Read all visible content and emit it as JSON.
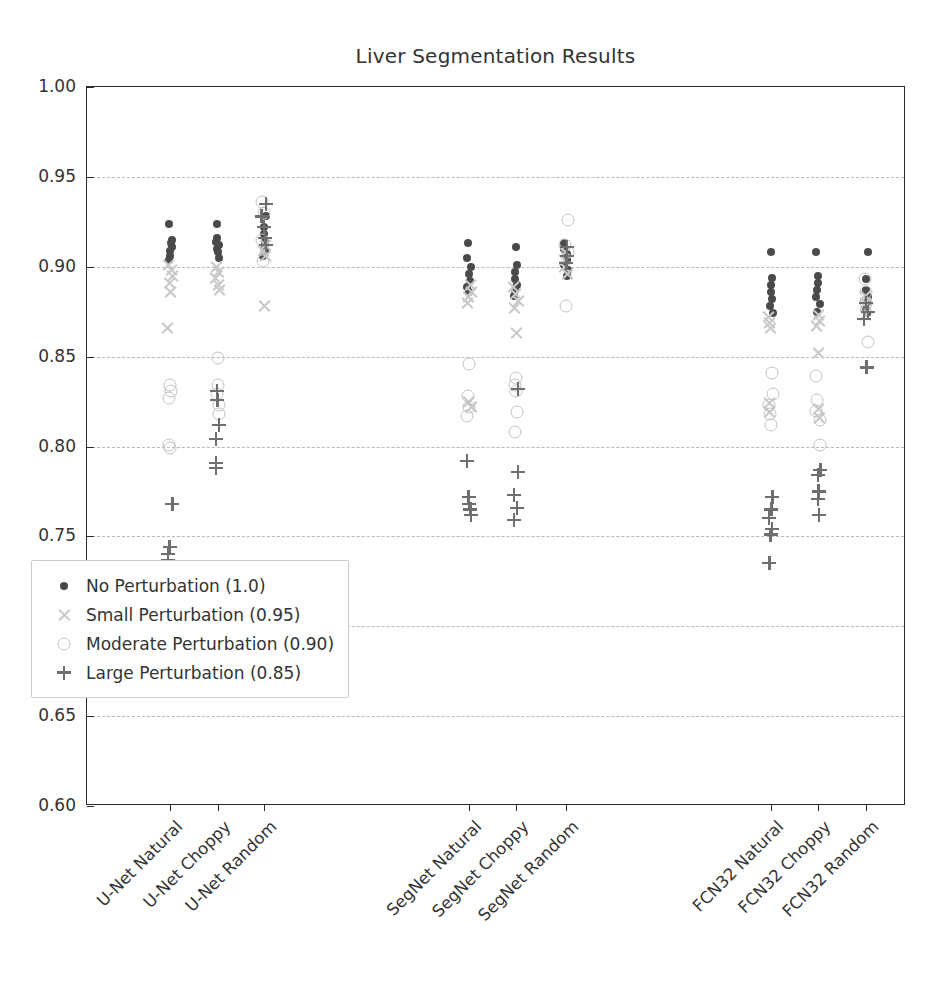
{
  "chart_data": {
    "type": "scatter",
    "title": "Liver Segmentation Results",
    "xlabel": "",
    "ylabel": "Dice Sorensen Score",
    "ylim": [
      0.6,
      1.0
    ],
    "yticks": [
      1.0,
      0.95,
      0.9,
      0.85,
      0.8,
      0.75,
      0.7,
      0.65,
      0.6
    ],
    "ytick_labels": [
      "1.00",
      "0.95",
      "0.90",
      "0.85",
      "0.80",
      "0.75",
      "0.70",
      "0.65",
      "0.60"
    ],
    "grid": true,
    "grid_axis": "y",
    "grid_style": "dashed",
    "legend_position": "lower left",
    "categories": [
      "U-Net Natural",
      "U-Net Choppy",
      "U-Net Random",
      "SegNet Natural",
      "SegNet Choppy",
      "SegNet Random",
      "FCN32 Natural",
      "FCN32 Choppy",
      "FCN32 Random"
    ],
    "series": [
      {
        "name": "No Perturbation (1.0)",
        "marker": "dot",
        "color": "#4a4a4a",
        "points": {
          "U-Net Natural": [
            0.924,
            0.915,
            0.913,
            0.911,
            0.909,
            0.906,
            0.904
          ],
          "U-Net Choppy": [
            0.924,
            0.916,
            0.914,
            0.912,
            0.91,
            0.908,
            0.905
          ],
          "U-Net Random": [
            0.928,
            0.922,
            0.918,
            0.914,
            0.911,
            0.909,
            0.906
          ],
          "SegNet Natural": [
            0.913,
            0.905,
            0.9,
            0.896,
            0.892,
            0.889,
            0.886
          ],
          "SegNet Choppy": [
            0.911,
            0.901,
            0.897,
            0.893,
            0.89,
            0.887,
            0.884
          ],
          "SegNet Random": [
            0.913,
            0.91,
            0.907,
            0.904,
            0.901,
            0.898,
            0.895
          ],
          "FCN32 Natural": [
            0.908,
            0.894,
            0.89,
            0.886,
            0.882,
            0.878,
            0.874
          ],
          "FCN32 Choppy": [
            0.908,
            0.895,
            0.891,
            0.887,
            0.883,
            0.879,
            0.875
          ],
          "FCN32 Random": [
            0.908,
            0.893,
            0.887,
            0.883,
            0.88,
            0.877,
            0.874
          ]
        }
      },
      {
        "name": "Small Perturbation (0.95)",
        "marker": "x",
        "color": "#c8c8c8",
        "points": {
          "U-Net Natural": [
            0.901,
            0.898,
            0.895,
            0.891,
            0.886,
            0.866
          ],
          "U-Net Choppy": [
            0.9,
            0.897,
            0.894,
            0.89,
            0.887
          ],
          "U-Net Random": [
            0.912,
            0.909,
            0.906,
            0.878
          ],
          "SegNet Natural": [
            0.89,
            0.886,
            0.883,
            0.88,
            0.825,
            0.822
          ],
          "SegNet Choppy": [
            0.889,
            0.885,
            0.881,
            0.877,
            0.863
          ],
          "SegNet Random": [
            0.908,
            0.904,
            0.9,
            0.896
          ],
          "FCN32 Natural": [
            0.872,
            0.869,
            0.866,
            0.824,
            0.819
          ],
          "FCN32 Choppy": [
            0.873,
            0.87,
            0.867,
            0.852,
            0.821,
            0.816
          ],
          "FCN32 Random": [
            0.884,
            0.88,
            0.877,
            0.873
          ]
        }
      },
      {
        "name": "Moderate Perturbation (0.90)",
        "marker": "circle",
        "color": "#c2c2c2",
        "points": {
          "U-Net Natural": [
            0.834,
            0.831,
            0.827,
            0.801,
            0.799
          ],
          "U-Net Choppy": [
            0.849,
            0.834,
            0.829,
            0.823,
            0.818
          ],
          "U-Net Random": [
            0.936,
            0.93,
            0.915,
            0.903
          ],
          "SegNet Natural": [
            0.846,
            0.828,
            0.822,
            0.817
          ],
          "SegNet Choppy": [
            0.838,
            0.834,
            0.831,
            0.819,
            0.808
          ],
          "SegNet Random": [
            0.926,
            0.912,
            0.908,
            0.878
          ],
          "FCN32 Natural": [
            0.841,
            0.829,
            0.823,
            0.818,
            0.812
          ],
          "FCN32 Choppy": [
            0.839,
            0.826,
            0.82,
            0.815,
            0.801
          ],
          "FCN32 Random": [
            0.893,
            0.886,
            0.88,
            0.858
          ]
        }
      },
      {
        "name": "Large Perturbation (0.85)",
        "marker": "plus",
        "color": "#6e6e6e",
        "points": {
          "U-Net Natural": [
            0.768,
            0.744,
            0.74,
            0.737
          ],
          "U-Net Choppy": [
            0.831,
            0.826,
            0.812,
            0.804,
            0.791,
            0.788
          ],
          "U-Net Random": [
            0.935,
            0.928,
            0.922,
            0.916,
            0.912
          ],
          "SegNet Natural": [
            0.792,
            0.772,
            0.768,
            0.765,
            0.762
          ],
          "SegNet Choppy": [
            0.832,
            0.786,
            0.773,
            0.766,
            0.759
          ],
          "SegNet Random": [
            0.911,
            0.906,
            0.902
          ],
          "FCN32 Natural": [
            0.772,
            0.765,
            0.76,
            0.754,
            0.751,
            0.735
          ],
          "FCN32 Choppy": [
            0.787,
            0.784,
            0.775,
            0.771,
            0.762
          ],
          "FCN32 Random": [
            0.88,
            0.875,
            0.871,
            0.844
          ]
        }
      }
    ]
  },
  "legend": {
    "items": [
      {
        "label": "No Perturbation (1.0)",
        "marker": "dot"
      },
      {
        "label": "Small Perturbation (0.95)",
        "marker": "x"
      },
      {
        "label": "Moderate Perturbation (0.90)",
        "marker": "circle"
      },
      {
        "label": "Large Perturbation (0.85)",
        "marker": "plus"
      }
    ]
  }
}
